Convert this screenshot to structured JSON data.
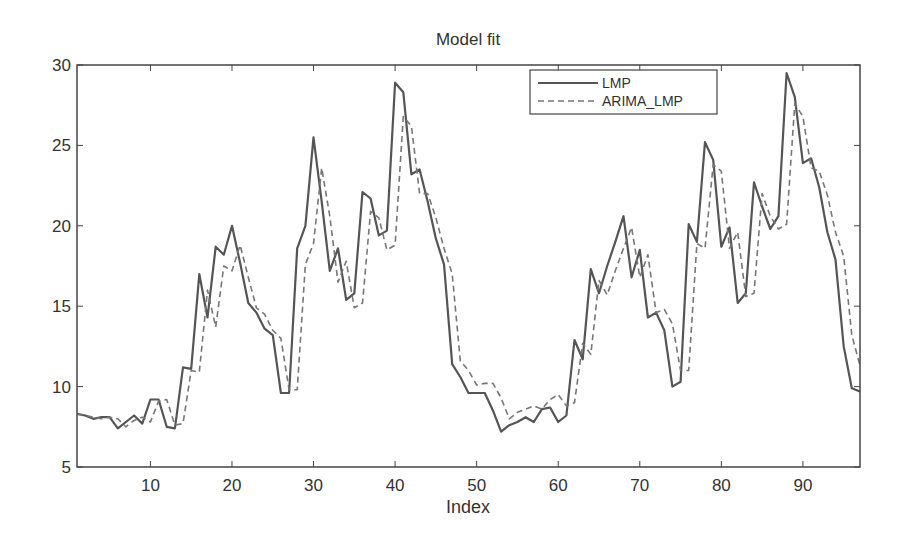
{
  "chart_data": {
    "type": "line",
    "title": "Model fit",
    "xlabel": "Index",
    "ylabel": "",
    "xlim": [
      1,
      97
    ],
    "ylim": [
      5,
      30
    ],
    "xticks": [
      10,
      20,
      30,
      40,
      50,
      60,
      70,
      80,
      90
    ],
    "yticks": [
      5,
      10,
      15,
      20,
      25,
      30
    ],
    "grid": false,
    "legend_position": "top-right",
    "x": [
      1,
      2,
      3,
      4,
      5,
      6,
      7,
      8,
      9,
      10,
      11,
      12,
      13,
      14,
      15,
      16,
      17,
      18,
      19,
      20,
      21,
      22,
      23,
      24,
      25,
      26,
      27,
      28,
      29,
      30,
      31,
      32,
      33,
      34,
      35,
      36,
      37,
      38,
      39,
      40,
      41,
      42,
      43,
      44,
      45,
      46,
      47,
      48,
      49,
      50,
      51,
      52,
      53,
      54,
      55,
      56,
      57,
      58,
      59,
      60,
      61,
      62,
      63,
      64,
      65,
      66,
      67,
      68,
      69,
      70,
      71,
      72,
      73,
      74,
      75,
      76,
      77,
      78,
      79,
      80,
      81,
      82,
      83,
      84,
      85,
      86,
      87,
      88,
      89,
      90,
      91,
      92,
      93,
      94,
      95,
      96,
      97
    ],
    "series": [
      {
        "name": "LMP",
        "style": "solid",
        "color": "#555555",
        "values": [
          8.3,
          8.2,
          8.0,
          8.1,
          8.1,
          7.4,
          7.8,
          8.2,
          7.7,
          9.2,
          9.2,
          7.5,
          7.4,
          11.2,
          11.1,
          17.0,
          14.3,
          18.7,
          18.2,
          20.0,
          17.7,
          15.2,
          14.6,
          13.6,
          13.2,
          9.6,
          9.6,
          18.6,
          20.0,
          25.5,
          21.5,
          17.2,
          18.6,
          15.4,
          15.8,
          22.1,
          21.7,
          19.4,
          19.7,
          28.9,
          28.3,
          23.2,
          23.5,
          21.5,
          19.2,
          17.6,
          11.4,
          10.6,
          9.6,
          9.6,
          9.6,
          8.5,
          7.2,
          7.6,
          7.8,
          8.1,
          7.8,
          8.6,
          8.7,
          7.8,
          8.2,
          12.9,
          11.7,
          17.3,
          15.8,
          17.5,
          19.0,
          20.6,
          16.8,
          18.5,
          14.3,
          14.6,
          13.5,
          10.0,
          10.3,
          20.1,
          19.0,
          25.2,
          24.1,
          18.7,
          19.9,
          15.2,
          15.8,
          22.7,
          21.2,
          19.8,
          20.6,
          29.5,
          28.0,
          23.9,
          24.2,
          22.4,
          19.6,
          17.9,
          12.5,
          9.9,
          9.7
        ]
      },
      {
        "name": "ARIMA_LMP",
        "style": "dashed",
        "color": "#777777",
        "values": [
          8.3,
          8.2,
          8.1,
          8.0,
          8.1,
          8.0,
          7.5,
          7.9,
          8.1,
          7.8,
          9.1,
          9.2,
          7.6,
          7.7,
          11.0,
          10.9,
          16.0,
          13.7,
          17.5,
          17.2,
          18.8,
          16.8,
          14.9,
          14.5,
          13.5,
          13.0,
          9.8,
          9.8,
          17.6,
          18.9,
          23.6,
          20.6,
          16.5,
          17.8,
          14.9,
          15.2,
          20.9,
          20.5,
          18.5,
          18.8,
          26.8,
          26.2,
          22.0,
          22.0,
          20.5,
          18.6,
          17.0,
          11.6,
          11.0,
          10.1,
          10.2,
          10.2,
          9.3,
          8.0,
          8.4,
          8.6,
          8.8,
          8.6,
          9.2,
          9.5,
          8.8,
          9.0,
          12.7,
          12.0,
          16.6,
          15.7,
          17.2,
          18.6,
          19.9,
          16.8,
          18.2,
          14.6,
          14.8,
          13.9,
          11.0,
          11.0,
          18.9,
          18.6,
          23.8,
          23.4,
          18.6,
          19.6,
          15.6,
          15.8,
          22.0,
          20.6,
          19.8,
          20.1,
          27.6,
          26.8,
          23.6,
          23.4,
          21.9,
          19.6,
          18.1,
          13.2,
          11.3
        ]
      }
    ]
  }
}
